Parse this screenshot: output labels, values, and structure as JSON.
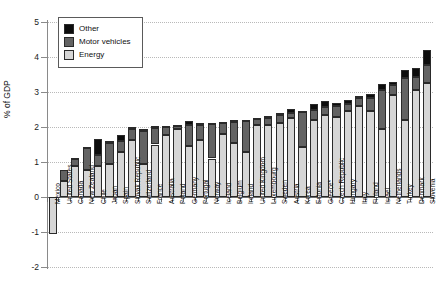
{
  "chart_data": {
    "type": "bar",
    "stacked": true,
    "title": "",
    "xlabel": "",
    "ylabel": "% of GDP",
    "ylim": [
      -2,
      5
    ],
    "yticks": [
      -2,
      -1,
      0,
      1,
      2,
      3,
      4,
      5
    ],
    "ytick_labels": [
      "-2",
      "-1",
      "0",
      "1",
      "2",
      "3",
      "4",
      "5"
    ],
    "grid": true,
    "legend_position": "top-left",
    "legend": [
      "Other",
      "Motor vehicles",
      "Energy"
    ],
    "colors": {
      "Other": "#0d0d0d",
      "Motor vehicles": "#636363",
      "Energy": "#d6d6d6"
    },
    "categories": [
      "Mexico",
      "United States",
      "Canada",
      "New Zealand",
      "Chile",
      "Japan",
      "Spain",
      "Slovak Republic",
      "Switzerland",
      "France",
      "Australia",
      "Poland",
      "Germany",
      "Portugal",
      "Norway",
      "Iceland",
      "Belgium",
      "Ireland",
      "United Kingdom",
      "Luxembourg",
      "Sweden",
      "Austria",
      "Korea",
      "Estonia",
      "Greece*",
      "Czech Republic",
      "Hungary",
      "Italy",
      "Finland",
      "Israel",
      "Netherlands",
      "Turkey",
      "Denmark",
      "Slovenia"
    ],
    "series": [
      {
        "name": "Energy",
        "values": [
          -1.05,
          0.47,
          0.88,
          0.78,
          0.88,
          0.95,
          1.28,
          1.62,
          0.95,
          1.5,
          1.78,
          1.95,
          1.45,
          1.62,
          1.1,
          1.8,
          1.55,
          1.28,
          2.05,
          2.05,
          2.12,
          2.25,
          1.42,
          2.2,
          2.35,
          2.3,
          2.45,
          2.6,
          2.45,
          1.95,
          2.92,
          2.2,
          3.05,
          3.25
        ]
      },
      {
        "name": "Motor vehicles",
        "values": [
          0.0,
          0.3,
          0.22,
          0.62,
          0.32,
          0.58,
          0.32,
          0.33,
          0.95,
          0.47,
          0.22,
          0.08,
          0.6,
          0.45,
          0.98,
          0.32,
          0.6,
          0.88,
          0.18,
          0.22,
          0.22,
          0.15,
          1.0,
          0.3,
          0.22,
          0.3,
          0.22,
          0.22,
          0.38,
          1.12,
          0.28,
          1.2,
          0.38,
          0.52
        ]
      },
      {
        "name": "Other",
        "values": [
          0.0,
          0.0,
          0.02,
          0.02,
          0.45,
          0.08,
          0.18,
          0.05,
          0.05,
          0.05,
          0.02,
          0.02,
          0.12,
          0.05,
          0.04,
          0.02,
          0.05,
          0.05,
          0.03,
          0.05,
          0.05,
          0.12,
          0.05,
          0.15,
          0.18,
          0.1,
          0.1,
          0.08,
          0.12,
          0.15,
          0.1,
          0.22,
          0.25,
          0.42
        ]
      }
    ],
    "totals": [
      -1.05,
      0.77,
      1.12,
      1.42,
      1.65,
      1.61,
      1.78,
      2.0,
      1.95,
      2.02,
      2.02,
      2.05,
      2.17,
      2.12,
      2.12,
      2.14,
      2.2,
      2.21,
      2.26,
      2.32,
      2.39,
      2.52,
      2.47,
      2.65,
      2.75,
      2.7,
      2.77,
      2.9,
      2.95,
      3.22,
      3.3,
      3.62,
      3.68,
      4.19
    ]
  }
}
